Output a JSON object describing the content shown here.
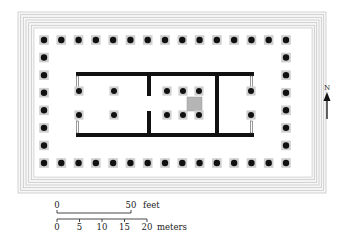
{
  "diagram": {
    "type": "temple-ground-plan",
    "colors": {
      "background": "#ffffff",
      "ink": "#111111",
      "step_lines": "#c8c8c8",
      "column_base": "#cfcfcf",
      "statue_base": "#b5b5b5",
      "stylobate_edge": "#d8d8d8"
    },
    "platform": {
      "outer": {
        "x": 18,
        "y": 12,
        "w": 308,
        "h": 181
      },
      "inner": {
        "x": 34,
        "y": 28,
        "w": 278,
        "h": 149
      },
      "step_count": 6
    },
    "peristyle": {
      "front_columns": 15,
      "side_columns": 8,
      "x_start": 44,
      "x_end": 286,
      "y_start": 40,
      "y_end": 163,
      "column_radius": 3.2
    },
    "cella": {
      "outer": {
        "x": 76,
        "y": 72,
        "w": 178,
        "h": 65
      },
      "wall_thickness": 4,
      "cross_walls": [
        {
          "x": 147,
          "door_from": 96,
          "door_to": 111
        },
        {
          "x": 215,
          "door_from": null,
          "door_to": null
        }
      ],
      "pronaos_columns": [
        {
          "x": 79,
          "y": 91
        },
        {
          "x": 79,
          "y": 115
        },
        {
          "x": 114,
          "y": 91
        },
        {
          "x": 114,
          "y": 115
        }
      ],
      "naos_columns": [
        {
          "x": 167,
          "y": 91
        },
        {
          "x": 183,
          "y": 91
        },
        {
          "x": 199,
          "y": 91
        },
        {
          "x": 167,
          "y": 115
        },
        {
          "x": 183,
          "y": 115
        },
        {
          "x": 199,
          "y": 115
        }
      ],
      "opisthodomos_columns": [
        {
          "x": 251,
          "y": 91
        },
        {
          "x": 251,
          "y": 115
        }
      ],
      "statue_base": {
        "x": 187,
        "y": 97,
        "w": 15,
        "h": 14
      }
    },
    "north_arrow": {
      "label": "N",
      "x": 327,
      "label_y": 90,
      "tip_y": 92,
      "tail_y": 119
    },
    "scale_bar": {
      "feet": {
        "y": 213,
        "x_start": 57,
        "x_end": 131,
        "labels": [
          {
            "text": "0",
            "x": 57
          },
          {
            "text": "50",
            "x": 131
          }
        ],
        "unit": "feet",
        "unit_x": 143
      },
      "meters": {
        "y": 219,
        "x_start": 57,
        "x_end": 147,
        "ticks": [
          57,
          79.5,
          102,
          124.5,
          147
        ],
        "labels": [
          {
            "text": "0",
            "x": 57
          },
          {
            "text": "5",
            "x": 79.5
          },
          {
            "text": "10",
            "x": 102
          },
          {
            "text": "15",
            "x": 124.5
          },
          {
            "text": "20",
            "x": 147
          }
        ],
        "unit": "meters",
        "unit_x": 157
      }
    }
  }
}
